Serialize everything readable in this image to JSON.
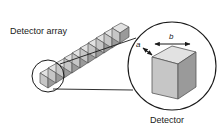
{
  "figure": {
    "type": "technical-diagram",
    "background_color": "#ffffff",
    "width": 222,
    "height": 129
  },
  "labels": {
    "detector_array": "Detector array",
    "detector": "Detector",
    "dimension_a": "a",
    "dimension_b": "b"
  },
  "colors": {
    "outline": "#1a1a1a",
    "cube_top": "#e2e2e2",
    "cube_front": "#c6c6c6",
    "cube_side": "#9a9a9a",
    "cube_edge": "#555555",
    "callout_line": "#1a1a1a",
    "text": "#1a1a1a"
  },
  "detector_array": {
    "description": "Diagonal row of cubic detector elements",
    "element_count": 10,
    "orientation": "diagonal, ascending to the upper right"
  },
  "callout": {
    "source_circle": {
      "cx": 48,
      "cy": 76,
      "r": 16
    },
    "target_circle": {
      "cx": 172,
      "cy": 66,
      "r": 44
    },
    "magnified_item": "single detector cube"
  },
  "magnified_cube": {
    "face_labels": [
      "a",
      "b"
    ],
    "a_edge": "depth dimension, upper-left diagonal edge",
    "b_edge": "width dimension, top front edge"
  }
}
